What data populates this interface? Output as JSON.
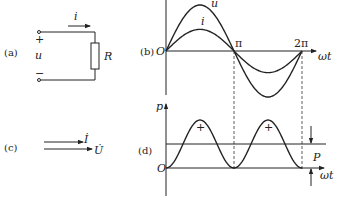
{
  "panels": {
    "a": {
      "caption": "(a)",
      "current_label": "i",
      "voltage_label": "u",
      "plus_sign": "+",
      "minus_sign": "−",
      "resistor_label": "R"
    },
    "b": {
      "caption": "(b)",
      "origin_label": "O",
      "x_axis_label": "ωt",
      "tick_pi": "π",
      "tick_2pi": "2π",
      "curve_u_label": "u",
      "curve_i_label": "i"
    },
    "c": {
      "caption": "(c)",
      "phasor_i_label": "İ",
      "phasor_u_label": "U̇"
    },
    "d": {
      "caption": "(d)",
      "origin_label": "O",
      "y_axis_label": "p",
      "x_axis_label": "ωt",
      "average_label": "P",
      "positive_sign_1": "+",
      "positive_sign_2": "+"
    }
  },
  "chart_data": [
    {
      "type": "line",
      "title": "(b)",
      "xlabel": "ωt",
      "ylabel": "",
      "x_ticks": [
        "π",
        "2π"
      ],
      "x_range": [
        0,
        6.2832
      ],
      "series": [
        {
          "name": "u",
          "function": "U_m·sin(ωt)",
          "amplitude": 1.0
        },
        {
          "name": "i",
          "function": "I_m·sin(ωt)",
          "amplitude": 0.47
        }
      ]
    },
    {
      "type": "line",
      "title": "(d)",
      "xlabel": "ωt",
      "ylabel": "p",
      "x_range": [
        0,
        6.2832
      ],
      "series": [
        {
          "name": "p",
          "function": "P·(1 − cos 2ωt)",
          "min": 0,
          "max": 2
        }
      ],
      "average": {
        "name": "P",
        "value": 1
      }
    }
  ]
}
